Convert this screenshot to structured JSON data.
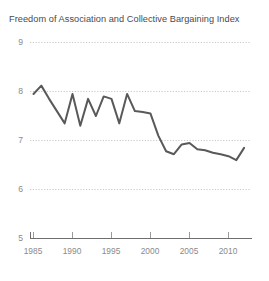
{
  "chart_data": {
    "type": "line",
    "title": "Freedom of Association and Collective Bargaining Index",
    "xlabel": "",
    "ylabel": "",
    "xlim": [
      1985,
      2012
    ],
    "ylim": [
      5,
      9
    ],
    "yticks": [
      5,
      6,
      7,
      8,
      9
    ],
    "xticks": [
      1985,
      1990,
      1995,
      2000,
      2005,
      2010
    ],
    "grid": "horizontal-dotted",
    "legend": "none",
    "line_color": "#595959",
    "grid_color": "#c8c8c8",
    "axis_color": "#6e6e6e",
    "label_color": "#8a8a8a",
    "title_color": "#4a4a4a",
    "x": [
      1985,
      1986,
      1987,
      1988,
      1989,
      1990,
      1991,
      1992,
      1993,
      1994,
      1995,
      1996,
      1997,
      1998,
      1999,
      2000,
      2001,
      2002,
      2003,
      2004,
      2005,
      2006,
      2007,
      2008,
      2009,
      2010,
      2011,
      2012
    ],
    "values": [
      7.95,
      8.12,
      7.85,
      7.6,
      7.35,
      7.95,
      7.3,
      7.85,
      7.5,
      7.9,
      7.85,
      7.35,
      7.95,
      7.6,
      7.58,
      7.55,
      7.1,
      6.78,
      6.72,
      6.92,
      6.95,
      6.82,
      6.8,
      6.75,
      6.72,
      6.68,
      6.6,
      6.85
    ],
    "series": [
      {
        "name": "Freedom of Association and Collective Bargaining Index",
        "values": [
          7.95,
          8.12,
          7.85,
          7.6,
          7.35,
          7.95,
          7.3,
          7.85,
          7.5,
          7.9,
          7.85,
          7.35,
          7.95,
          7.6,
          7.58,
          7.55,
          7.1,
          6.78,
          6.72,
          6.92,
          6.95,
          6.82,
          6.8,
          6.75,
          6.72,
          6.68,
          6.6,
          6.85
        ]
      }
    ]
  },
  "axis": {
    "y_tick_labels": [
      "9",
      "8",
      "7",
      "6",
      "5"
    ],
    "x_tick_labels": [
      "1985",
      "1990",
      "1995",
      "2000",
      "2005",
      "2010"
    ]
  }
}
